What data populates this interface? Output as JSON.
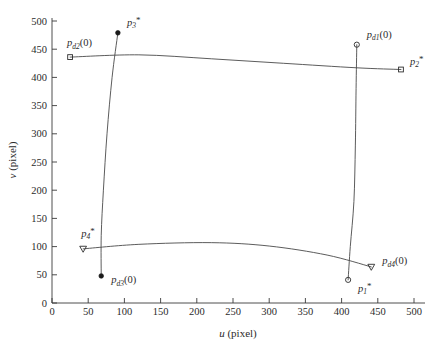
{
  "chart_data": {
    "type": "scatter",
    "title": "",
    "xlabel": "u (pixel)",
    "ylabel": "v (pixel)",
    "xlim": [
      0,
      510
    ],
    "ylim": [
      0,
      510
    ],
    "grid": false,
    "legend": "none",
    "xticks": [
      0,
      50,
      100,
      150,
      200,
      250,
      300,
      350,
      400,
      450,
      500
    ],
    "yticks": [
      0,
      50,
      100,
      150,
      200,
      250,
      300,
      350,
      400,
      450,
      500
    ],
    "xtick_labels": [
      "0",
      "50",
      "100",
      "150",
      "200",
      "250",
      "300",
      "350",
      "400",
      "450",
      "500"
    ],
    "ytick_labels": [
      "0",
      "50",
      "100",
      "150",
      "200",
      "250",
      "300",
      "350",
      "400",
      "450",
      "500"
    ],
    "points": [
      {
        "id": "p1star",
        "label": "p₁*",
        "label_base": "p",
        "label_sub": "1",
        "label_star": "*",
        "marker": "circle-open",
        "u": 409,
        "v": 41,
        "label_dx": 10,
        "label_dy": 12
      },
      {
        "id": "p2star",
        "label": "p₂*",
        "label_base": "p",
        "label_sub": "2",
        "label_star": "*",
        "marker": "square-open",
        "u": 482,
        "v": 414,
        "label_dx": 9,
        "label_dy": -5
      },
      {
        "id": "p3star",
        "label": "p₃*",
        "label_base": "p",
        "label_sub": "3",
        "label_star": "*",
        "marker": "circle-filled",
        "u": 91,
        "v": 479,
        "label_dx": 9,
        "label_dy": -7
      },
      {
        "id": "p4star",
        "label": "p₄*",
        "label_base": "p",
        "label_sub": "4",
        "label_star": "*",
        "marker": "triangle-down",
        "u": 43,
        "v": 96,
        "label_dx": -2,
        "label_dy": -12
      },
      {
        "id": "pd1",
        "label": "p_d1(0)",
        "label_base": "p",
        "label_sub": "d1",
        "label_suffix": "(0)",
        "marker": "circle-open",
        "u": 421,
        "v": 458,
        "label_dx": 10,
        "label_dy": -7
      },
      {
        "id": "pd2",
        "label": "p_d2(0)",
        "label_base": "p",
        "label_sub": "d2",
        "label_suffix": "(0)",
        "marker": "square-open",
        "u": 25,
        "v": 436,
        "label_dx": -3,
        "label_dy": -11
      },
      {
        "id": "pd3",
        "label": "p_d3(0)",
        "label_base": "p",
        "label_sub": "d3",
        "label_suffix": "(0)",
        "marker": "circle-filled",
        "u": 68,
        "v": 48,
        "label_dx": 10,
        "label_dy": 7
      },
      {
        "id": "pd4",
        "label": "p_d4(0)",
        "label_base": "p",
        "label_sub": "d4",
        "label_suffix": "(0)",
        "marker": "triangle-down",
        "u": 441,
        "v": 64,
        "label_dx": 11,
        "label_dy": -3
      }
    ],
    "series": [
      {
        "name": "top-edge-trajectory",
        "description": "near-horizontal curve from p_d2(0) region to p_2*",
        "points_uv": [
          [
            25,
            436
          ],
          [
            120,
            440
          ],
          [
            220,
            433
          ],
          [
            320,
            425
          ],
          [
            421,
            417
          ],
          [
            482,
            414
          ]
        ]
      },
      {
        "name": "left-edge-trajectory",
        "description": "near-vertical curve from p_3* down to p_d3(0)",
        "points_uv": [
          [
            91,
            479
          ],
          [
            83,
            400
          ],
          [
            76,
            300
          ],
          [
            71,
            200
          ],
          [
            68,
            120
          ],
          [
            68,
            48
          ]
        ]
      },
      {
        "name": "bottom-edge-trajectory",
        "description": "near-horizontal curve from p_4* to p_d4(0)",
        "points_uv": [
          [
            43,
            96
          ],
          [
            120,
            104
          ],
          [
            220,
            107
          ],
          [
            300,
            101
          ],
          [
            380,
            85
          ],
          [
            441,
            64
          ]
        ]
      },
      {
        "name": "right-edge-trajectory",
        "description": "near-vertical curve from p_d1(0) down to p_1*",
        "points_uv": [
          [
            421,
            458
          ],
          [
            420,
            380
          ],
          [
            419,
            280
          ],
          [
            417,
            180
          ],
          [
            412,
            100
          ],
          [
            409,
            41
          ]
        ]
      }
    ]
  },
  "axes": {
    "x_axis_name": "u-axis",
    "y_axis_name": "v-axis"
  }
}
